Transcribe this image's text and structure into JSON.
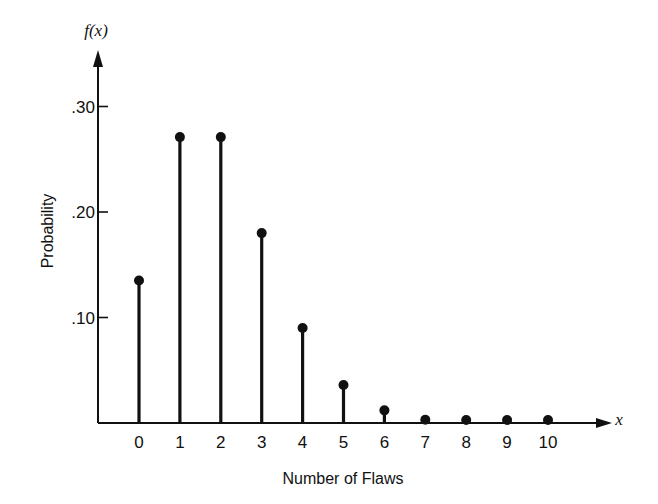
{
  "chart_data": {
    "type": "stem",
    "title": "",
    "xlabel": "Number of Flaws",
    "ylabel": "Probability",
    "y_axis_symbol": "f(x)",
    "x_axis_symbol": "x",
    "categories": [
      "0",
      "1",
      "2",
      "3",
      "4",
      "5",
      "6",
      "7",
      "8",
      "9",
      "10"
    ],
    "x": [
      0,
      1,
      2,
      3,
      4,
      5,
      6,
      7,
      8,
      9,
      10
    ],
    "values": [
      0.135,
      0.271,
      0.271,
      0.18,
      0.09,
      0.036,
      0.012,
      0.003,
      0.001,
      0.0002,
      4e-05
    ],
    "yticks": [
      0.1,
      0.2,
      0.3
    ],
    "ytick_labels": [
      ".10",
      ".20",
      ".30"
    ],
    "ylim": [
      0,
      0.33
    ],
    "grid": false,
    "legend": null,
    "color": "#111111"
  },
  "layout": {
    "origin_x": 98,
    "baseline_y": 423,
    "px_per_unit_y": 1055,
    "first_stem_x": 139,
    "stem_spacing": 40.9,
    "x_axis_end": 612,
    "y_axis_top": 50
  }
}
